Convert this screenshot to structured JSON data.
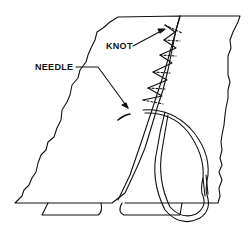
{
  "diagram": {
    "labels": {
      "knot": "KNOT",
      "needle": "NEEDLE"
    },
    "colors": {
      "line": "#111111",
      "background": "#ffffff"
    }
  }
}
